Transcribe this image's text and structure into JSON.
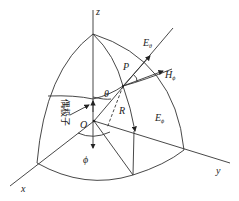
{
  "diagram": {
    "type": "spherical-coordinate-dipole",
    "labels": {
      "z_axis": "z",
      "x_axis": "x",
      "y_axis": "y",
      "origin": "O",
      "point": "P",
      "theta": "θ",
      "radius": "R",
      "phi": "ϕ",
      "e_theta_top": "E",
      "e_theta_top_sub": "θ",
      "h_phi": "H",
      "h_phi_sub": "ϕ",
      "e_phi": "E",
      "e_phi_sub": "ϕ",
      "dipole": "偶极子"
    },
    "colors": {
      "line": "#333333",
      "background": "#ffffff"
    }
  }
}
